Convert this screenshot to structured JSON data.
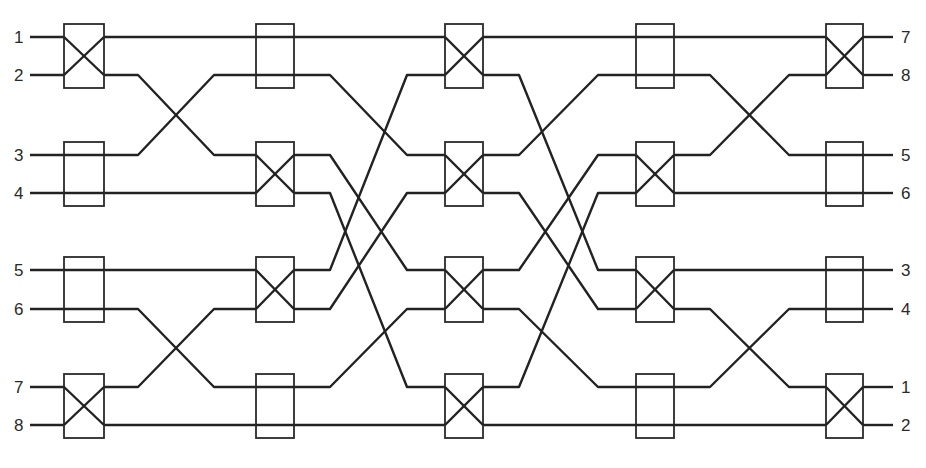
{
  "diagram": {
    "type": "switching-network",
    "colors": {
      "line": "#222222",
      "box": "#2a2a2a",
      "background": "#ffffff",
      "text": "#2a2a2a"
    },
    "rows_y": [
      37,
      75,
      155,
      193,
      270,
      309,
      387,
      425
    ],
    "columns": [
      {
        "x0": 64,
        "x1": 104,
        "states": [
          "cross",
          "bar",
          "bar",
          "cross"
        ]
      },
      {
        "x0": 256,
        "x1": 294,
        "states": [
          "bar",
          "cross",
          "cross",
          "bar"
        ]
      },
      {
        "x0": 445,
        "x1": 483,
        "states": [
          "cross",
          "cross",
          "cross",
          "cross"
        ]
      },
      {
        "x0": 636,
        "x1": 674,
        "states": [
          "bar",
          "cross",
          "cross",
          "bar"
        ]
      },
      {
        "x0": 826,
        "x1": 863,
        "states": [
          "cross",
          "bar",
          "bar",
          "cross"
        ]
      }
    ],
    "box_pad_y": 13,
    "interstage": [
      {
        "map": [
          0,
          2,
          1,
          3,
          4,
          6,
          5,
          7
        ],
        "bend_in": 138,
        "bend_out": 214
      },
      {
        "map": [
          0,
          2,
          4,
          6,
          1,
          3,
          5,
          7
        ],
        "bend_in": 330,
        "bend_out": 407
      },
      {
        "map": [
          0,
          4,
          1,
          5,
          2,
          6,
          3,
          7
        ],
        "bend_in": 519,
        "bend_out": 598
      },
      {
        "map": [
          0,
          2,
          1,
          3,
          4,
          6,
          5,
          7
        ],
        "bend_in": 710,
        "bend_out": 789
      }
    ],
    "inputs": {
      "x_start": 30,
      "label_x": 14,
      "labels": [
        "1",
        "2",
        "3",
        "4",
        "5",
        "6",
        "7",
        "8"
      ]
    },
    "outputs": {
      "x_end": 893,
      "label_x": 901,
      "labels": [
        "7",
        "8",
        "5",
        "6",
        "3",
        "4",
        "1",
        "2"
      ]
    }
  }
}
